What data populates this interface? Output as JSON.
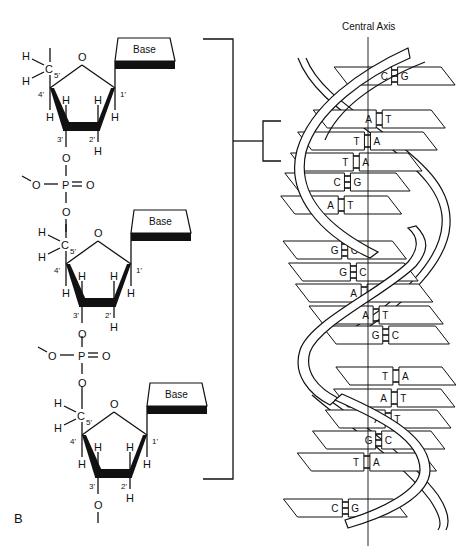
{
  "figure_label": "B",
  "axis_label": "Central Axis",
  "backbone": {
    "nucleotides": [
      {
        "y": 0,
        "base_label": "Base",
        "c5": "C",
        "c5_prime": "5'",
        "ring_oxygen": "O",
        "carbons": [
          "1'",
          "2'",
          "3'",
          "4'"
        ],
        "hydrogens": [
          "H",
          "H",
          "H",
          "H",
          "H",
          "H",
          "H"
        ],
        "oxygen_3": "O"
      },
      {
        "y": 176,
        "base_label": "Base",
        "c5": "C",
        "c5_prime": "5'",
        "ring_oxygen": "O",
        "carbons": [
          "1'",
          "2'",
          "3'",
          "4'"
        ],
        "hydrogens": [
          "H",
          "H",
          "H",
          "H",
          "H",
          "H",
          "H"
        ],
        "oxygen_3": "O"
      },
      {
        "y": 347,
        "base_label": "Base",
        "c5": "C",
        "c5_prime": "5'",
        "ring_oxygen": "O",
        "carbons": [
          "1'",
          "2'",
          "3'",
          "4'"
        ],
        "hydrogens": [
          "H",
          "H",
          "H",
          "H",
          "H",
          "H",
          "H"
        ],
        "oxygen_3": "O"
      }
    ],
    "phosphates": [
      {
        "P": "P",
        "O_double": "O",
        "O_left": "O",
        "O_bottom": "O"
      },
      {
        "P": "P",
        "O_double": "O",
        "O_left": "O",
        "O_bottom": "O"
      }
    ]
  },
  "helix": {
    "base_pairs": [
      {
        "left": "C",
        "right": "G",
        "y": 76,
        "bonds": 3
      },
      {
        "left": "A",
        "right": "T",
        "y": 119,
        "bonds": 2
      },
      {
        "left": "T",
        "right": "A",
        "y": 141,
        "bonds": 2
      },
      {
        "left": "T",
        "right": "A",
        "y": 162,
        "bonds": 2
      },
      {
        "left": "C",
        "right": "G",
        "y": 182,
        "bonds": 3
      },
      {
        "left": "A",
        "right": "T",
        "y": 205,
        "bonds": 2
      },
      {
        "left": "G",
        "right": "C",
        "y": 250,
        "bonds": 3
      },
      {
        "left": "G",
        "right": "C",
        "y": 272,
        "bonds": 3
      },
      {
        "left": "A",
        "right": "T",
        "y": 293,
        "bonds": 2
      },
      {
        "left": "A",
        "right": "T",
        "y": 315,
        "bonds": 2
      },
      {
        "left": "G",
        "right": "C",
        "y": 335,
        "bonds": 3
      },
      {
        "left": "T",
        "right": "A",
        "y": 376,
        "bonds": 2
      },
      {
        "left": "A",
        "right": "T",
        "y": 398,
        "bonds": 2
      },
      {
        "left": "A",
        "right": "T",
        "y": 419,
        "bonds": 2
      },
      {
        "left": "G",
        "right": "C",
        "y": 440,
        "bonds": 3
      },
      {
        "left": "T",
        "right": "A",
        "y": 462,
        "bonds": 2
      },
      {
        "left": "C",
        "right": "G",
        "y": 508,
        "bonds": 3
      }
    ]
  }
}
